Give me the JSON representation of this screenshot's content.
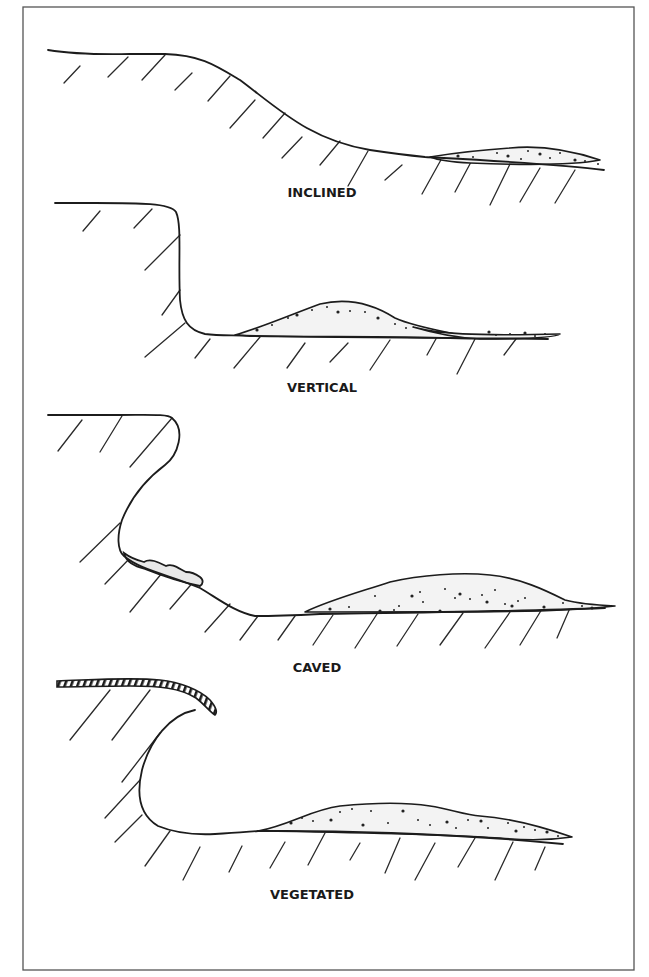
{
  "diagram": {
    "frame": {
      "x": 23,
      "y": 7,
      "width": 611,
      "height": 963,
      "stroke": "#555555"
    },
    "colors": {
      "ink": "#1c1c1c",
      "hatch": "#2a2a2a",
      "sediment_fill": "#f3f3f3",
      "sediment_dot": "#222222",
      "background": "#ffffff"
    },
    "profiles": [
      {
        "id": "inclined",
        "label": "INCLINED",
        "label_pos": {
          "x": 322,
          "y": 185
        },
        "ground": "M 48 50 C 60 52, 80 55, 130 54 L 165 54 C 200 55, 215 65, 240 80 C 280 110, 310 140, 370 150 C 390 153, 405 155, 425 157 C 480 160, 560 164, 604 170",
        "deposit": "M 430 157 C 460 152, 480 150, 510 148 C 540 145, 570 150, 600 160 C 570 166, 520 165, 470 163 C 450 162, 438 160, 430 157 Z",
        "deposit_dots": [
          [
            458,
            156
          ],
          [
            473,
            157
          ],
          [
            497,
            153
          ],
          [
            508,
            156
          ],
          [
            521,
            159
          ],
          [
            528,
            151
          ],
          [
            540,
            154
          ],
          [
            550,
            158
          ],
          [
            560,
            153
          ],
          [
            575,
            160
          ],
          [
            585,
            161
          ],
          [
            598,
            164
          ]
        ],
        "hatches": [
          [
            64,
            83,
            80,
            66
          ],
          [
            108,
            77,
            128,
            57
          ],
          [
            142,
            80,
            165,
            55
          ],
          [
            175,
            90,
            192,
            73
          ],
          [
            208,
            101,
            230,
            76
          ],
          [
            230,
            128,
            255,
            100
          ],
          [
            263,
            138,
            285,
            113
          ],
          [
            282,
            158,
            302,
            137
          ],
          [
            320,
            165,
            340,
            141
          ],
          [
            348,
            186,
            368,
            151
          ],
          [
            385,
            180,
            402,
            165
          ],
          [
            422,
            194,
            442,
            158
          ],
          [
            455,
            192,
            471,
            162
          ],
          [
            490,
            205,
            510,
            164
          ],
          [
            520,
            202,
            540,
            168
          ],
          [
            555,
            203,
            575,
            170
          ]
        ]
      },
      {
        "id": "vertical",
        "label": "VERTICAL",
        "label_pos": {
          "x": 322,
          "y": 380
        },
        "ground": "M 55 203 L 95 203 C 140 203, 170 203, 176 212 C 182 225, 178 260, 180 300 C 182 320, 188 330, 205 334 C 220 336, 235 335, 250 336 C 320 337, 400 336, 450 338 C 480 339, 520 338, 548 339",
        "deposit": "M 235 335 C 260 328, 290 315, 320 304 C 345 298, 370 302, 395 318 C 410 325, 440 331, 455 334 C 470 336, 480 337, 485 338 L 435 338 C 380 337, 300 338, 235 335 Z",
        "deposit2": "M 413 327 C 440 334, 470 336, 560 334 C 555 338, 510 339, 480 339 C 460 338, 440 335, 413 327 Z",
        "deposit_dots": [
          [
            257,
            330
          ],
          [
            272,
            325
          ],
          [
            288,
            318
          ],
          [
            297,
            315
          ],
          [
            312,
            310
          ],
          [
            327,
            307
          ],
          [
            338,
            312
          ],
          [
            350,
            311
          ],
          [
            365,
            312
          ],
          [
            378,
            318
          ],
          [
            395,
            324
          ],
          [
            406,
            328
          ],
          [
            489,
            332
          ],
          [
            496,
            335
          ],
          [
            510,
            334
          ],
          [
            525,
            333
          ],
          [
            535,
            336
          ],
          [
            545,
            334
          ]
        ],
        "hatches": [
          [
            83,
            231,
            100,
            211
          ],
          [
            134,
            228,
            152,
            209
          ],
          [
            145,
            270,
            180,
            235
          ],
          [
            162,
            315,
            180,
            290
          ],
          [
            145,
            357,
            185,
            323
          ],
          [
            195,
            358,
            210,
            339
          ],
          [
            234,
            368,
            260,
            337
          ],
          [
            287,
            368,
            305,
            343
          ],
          [
            330,
            362,
            348,
            343
          ],
          [
            370,
            370,
            390,
            340
          ],
          [
            427,
            355,
            437,
            337
          ],
          [
            457,
            374,
            475,
            339
          ],
          [
            504,
            355,
            516,
            339
          ]
        ]
      },
      {
        "id": "caved",
        "label": "CAVED",
        "label_pos": {
          "x": 317,
          "y": 660
        },
        "ground": "M 48 415 L 120 415 C 150 415, 168 414, 172 418 C 186 430, 178 455, 165 465 C 145 480, 130 500, 122 520 C 117 535, 117 550, 124 556 C 140 570, 170 575, 200 588 C 220 600, 235 612, 255 616 C 280 616, 300 615, 320 614 C 380 613, 500 612, 605 608",
        "caved_block": "M 124 553 C 128 556, 136 560, 144 562 C 150 558, 158 562, 166 566 C 172 563, 178 568, 186 572 C 192 572, 196 574, 200 577 C 204 580, 203 584, 200 586 C 180 582, 160 575, 145 569 C 134 566, 126 562, 124 553 Z",
        "deposit": "M 305 612 C 330 600, 360 592, 390 582 C 420 575, 460 572, 490 575 C 520 578, 545 590, 565 600 C 580 604, 595 605, 615 606 C 590 609, 570 610, 540 611 C 480 612, 400 612, 305 612 Z",
        "deposit_dots": [
          [
            330,
            609
          ],
          [
            349,
            607
          ],
          [
            375,
            596
          ],
          [
            380,
            611
          ],
          [
            394,
            610
          ],
          [
            399,
            606
          ],
          [
            412,
            596
          ],
          [
            420,
            592
          ],
          [
            423,
            602
          ],
          [
            440,
            611
          ],
          [
            445,
            589
          ],
          [
            455,
            598
          ],
          [
            460,
            594
          ],
          [
            470,
            599
          ],
          [
            482,
            595
          ],
          [
            487,
            602
          ],
          [
            495,
            590
          ],
          [
            505,
            604
          ],
          [
            512,
            606
          ],
          [
            518,
            601
          ],
          [
            525,
            598
          ],
          [
            544,
            607
          ],
          [
            563,
            603
          ],
          [
            582,
            606
          ],
          [
            592,
            608
          ]
        ],
        "hatches": [
          [
            58,
            451,
            82,
            420
          ],
          [
            100,
            452,
            122,
            416
          ],
          [
            130,
            467,
            172,
            418
          ],
          [
            80,
            562,
            120,
            523
          ],
          [
            105,
            584,
            130,
            558
          ],
          [
            130,
            612,
            162,
            573
          ],
          [
            170,
            609,
            195,
            580
          ],
          [
            205,
            632,
            230,
            604
          ],
          [
            240,
            640,
            258,
            616
          ],
          [
            278,
            640,
            295,
            616
          ],
          [
            313,
            645,
            333,
            615
          ],
          [
            355,
            648,
            377,
            614
          ],
          [
            397,
            646,
            418,
            614
          ],
          [
            440,
            645,
            463,
            613
          ],
          [
            485,
            648,
            510,
            612
          ],
          [
            520,
            645,
            542,
            609
          ],
          [
            557,
            638,
            570,
            608
          ]
        ]
      },
      {
        "id": "vegetated",
        "label": "VEGETATED",
        "label_pos": {
          "x": 312,
          "y": 887
        },
        "ground": "M 195 710 C 170 715, 150 740, 142 770 C 136 795, 140 815, 158 826 C 175 833, 195 835, 215 834 C 235 833, 245 832, 258 831 C 320 830, 450 833, 563 844",
        "vegetation_mat": "M 57 681 C 90 680, 130 677, 160 680 C 180 682, 200 690, 210 700 C 216 707, 218 712, 215 715 C 210 712, 204 704, 196 698 C 180 688, 160 686, 130 686 C 100 686, 80 687, 57 687 Z",
        "deposit": "M 258 831 C 290 825, 310 810, 340 806 C 370 803, 405 802, 430 806 C 450 809, 465 815, 480 816 C 510 818, 540 826, 572 837 C 545 841, 520 840, 500 838 C 430 834, 330 832, 258 831 Z",
        "deposit_dots": [
          [
            291,
            823
          ],
          [
            302,
            818
          ],
          [
            313,
            821
          ],
          [
            331,
            820
          ],
          [
            340,
            812
          ],
          [
            352,
            809
          ],
          [
            363,
            825
          ],
          [
            371,
            811
          ],
          [
            388,
            823
          ],
          [
            403,
            811
          ],
          [
            418,
            820
          ],
          [
            430,
            825
          ],
          [
            447,
            822
          ],
          [
            456,
            828
          ],
          [
            468,
            820
          ],
          [
            481,
            821
          ],
          [
            488,
            828
          ],
          [
            508,
            823
          ],
          [
            516,
            831
          ],
          [
            524,
            827
          ],
          [
            535,
            830
          ],
          [
            547,
            832
          ],
          [
            558,
            836
          ]
        ],
        "hatches": [
          [
            70,
            740,
            110,
            690
          ],
          [
            112,
            740,
            150,
            690
          ],
          [
            122,
            782,
            160,
            733
          ],
          [
            105,
            818,
            140,
            780
          ],
          [
            115,
            842,
            142,
            815
          ],
          [
            145,
            866,
            170,
            831
          ],
          [
            183,
            880,
            200,
            847
          ],
          [
            229,
            872,
            242,
            846
          ],
          [
            270,
            868,
            285,
            842
          ],
          [
            308,
            865,
            325,
            833
          ],
          [
            350,
            860,
            360,
            843
          ],
          [
            385,
            873,
            400,
            838
          ],
          [
            415,
            880,
            435,
            843
          ],
          [
            458,
            867,
            475,
            838
          ],
          [
            495,
            880,
            513,
            842
          ],
          [
            535,
            870,
            545,
            847
          ]
        ]
      }
    ]
  }
}
